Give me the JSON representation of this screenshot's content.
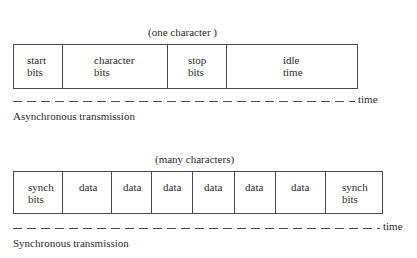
{
  "async": {
    "span_caption": "(one character )",
    "fields": [
      {
        "line1": "start",
        "line2": "bits"
      },
      {
        "line1": "character",
        "line2": "bits"
      },
      {
        "line1": "stop",
        "line2": "bits"
      },
      {
        "line1": "idle",
        "line2": "time"
      }
    ],
    "axis_label": "time",
    "title": "Asynchronous transmission"
  },
  "sync": {
    "span_caption": "(many characters)",
    "fields": [
      {
        "line1": "synch",
        "line2": "bits"
      },
      {
        "line1": "data",
        "line2": ""
      },
      {
        "line1": "data",
        "line2": ""
      },
      {
        "line1": "data",
        "line2": ""
      },
      {
        "line1": "data",
        "line2": ""
      },
      {
        "line1": "data",
        "line2": ""
      },
      {
        "line1": "data",
        "line2": ""
      },
      {
        "line1": "synch",
        "line2": "bits"
      }
    ],
    "axis_label": "time",
    "title": "Synchronous transmission"
  }
}
